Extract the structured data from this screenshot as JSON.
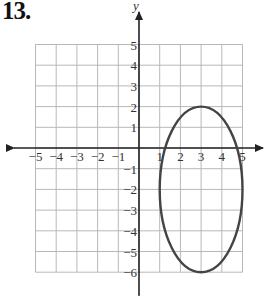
{
  "problem": {
    "number": "13."
  },
  "graph": {
    "x_axis_label": "x",
    "y_axis_label": "y",
    "x_range": [
      -5,
      5
    ],
    "y_range": [
      -6,
      5
    ],
    "x_ticks": [
      "−5",
      "−4",
      "−3",
      "−2",
      "−1",
      "1",
      "2",
      "3",
      "4",
      "5"
    ],
    "y_ticks": [
      "5",
      "4",
      "3",
      "2",
      "1",
      "−1",
      "−2",
      "−3",
      "−4",
      "−5",
      "−6"
    ],
    "grid_color": "#b8b8b8",
    "axis_color": "#222222",
    "curve_color": "#444444"
  },
  "chart_data": {
    "type": "line",
    "title": "13.",
    "shape": "ellipse",
    "center": [
      3,
      -2
    ],
    "horizontal_radius": 2,
    "vertical_radius": 4,
    "vertices": [
      [
        3,
        2
      ],
      [
        3,
        -6
      ]
    ],
    "co_vertices": [
      [
        1,
        -2
      ],
      [
        5,
        -2
      ]
    ],
    "equation": "(x-3)^2/4 + (y+2)^2/16 = 1",
    "xlabel": "x",
    "ylabel": "y",
    "xlim": [
      -5,
      5
    ],
    "ylim": [
      -6,
      5
    ],
    "grid": true
  }
}
